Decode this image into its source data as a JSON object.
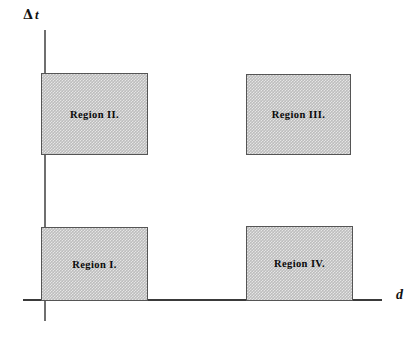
{
  "diagram": {
    "background_color": "#ffffff",
    "axes": {
      "y": {
        "label_delta": "Δ",
        "label_variable": "t",
        "label_full": "Δt",
        "name": "Delta t",
        "color": "#6f6f6f"
      },
      "x": {
        "label": "d",
        "name": "d",
        "color": "#3a3a3a"
      }
    },
    "fill_color": "#bdbdbd",
    "border_color": "#555555",
    "text_color": "#0a0a0a",
    "regions": [
      {
        "id": "region-1",
        "label": "Region I.",
        "quadrant": "lower-left",
        "x_range_px": [
          41,
          148
        ],
        "y_range_px": [
          227,
          301
        ]
      },
      {
        "id": "region-2",
        "label": "Region II.",
        "quadrant": "upper-left",
        "x_range_px": [
          41,
          148
        ],
        "y_range_px": [
          73,
          155
        ]
      },
      {
        "id": "region-3",
        "label": "Region III.",
        "quadrant": "upper-right",
        "x_range_px": [
          246,
          351
        ],
        "y_range_px": [
          74,
          155
        ]
      },
      {
        "id": "region-4",
        "label": "Region IV.",
        "quadrant": "lower-right",
        "x_range_px": [
          246,
          353
        ],
        "y_range_px": [
          226,
          301
        ]
      }
    ]
  },
  "chart_data": {
    "type": "scatter",
    "title": "",
    "xlabel": "d",
    "ylabel": "Δt",
    "grid": false,
    "legend_position": "none",
    "annotations": [
      {
        "text": "Region I.",
        "x_center_px": 94,
        "y_center_px": 264
      },
      {
        "text": "Region II.",
        "x_center_px": 94,
        "y_center_px": 114
      },
      {
        "text": "Region III.",
        "x_center_px": 298,
        "y_center_px": 114
      },
      {
        "text": "Region IV.",
        "x_center_px": 299,
        "y_center_px": 263
      }
    ],
    "shaded_rectangles": [
      {
        "label": "Region I.",
        "x0": 41,
        "x1": 148,
        "y0": 227,
        "y1": 301
      },
      {
        "label": "Region II.",
        "x0": 41,
        "x1": 148,
        "y0": 73,
        "y1": 155
      },
      {
        "label": "Region III.",
        "x0": 246,
        "x1": 351,
        "y0": 74,
        "y1": 155
      },
      {
        "label": "Region IV.",
        "x0": 246,
        "x1": 353,
        "y0": 226,
        "y1": 301
      }
    ]
  }
}
